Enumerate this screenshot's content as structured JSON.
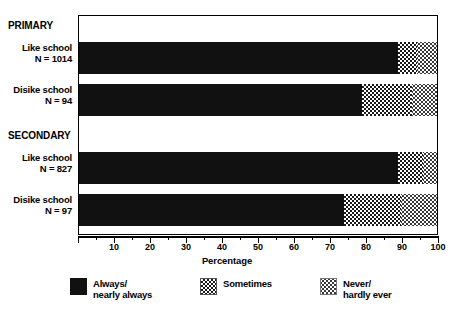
{
  "chart_data": {
    "type": "bar",
    "orientation": "horizontal",
    "stacked": true,
    "title": "",
    "xlabel": "Percentage",
    "ylabel": "",
    "xlim": [
      0,
      100
    ],
    "xticks": [
      0,
      10,
      20,
      30,
      40,
      50,
      60,
      70,
      80,
      90,
      100
    ],
    "xticklabels": [
      "",
      "10",
      "20",
      "30",
      "40",
      "50",
      "60",
      "70",
      "80",
      "90",
      "100"
    ],
    "minor_tick_step": 5,
    "grid": false,
    "legend_position": "bottom",
    "groups": [
      {
        "name": "PRIMARY"
      },
      {
        "name": "SECONDARY"
      }
    ],
    "categories": [
      "Like school N = 1014",
      "Disike school N = 94",
      "Like school N = 827",
      "Disike school N = 97"
    ],
    "series": [
      {
        "name": "Always/ nearly always",
        "values": [
          89,
          79,
          89,
          74
        ]
      },
      {
        "name": "Sometimes",
        "values": [
          5.5,
          14,
          7,
          16
        ]
      },
      {
        "name": "Never/ hardly ever",
        "values": [
          5.5,
          7,
          4,
          10
        ]
      }
    ]
  },
  "labels": {
    "group_primary": "PRIMARY",
    "group_secondary": "SECONDARY",
    "bar1_line1": "Like school",
    "bar1_line2": "N = 1014",
    "bar2_line1": "Disike school",
    "bar2_line2": "N = 94",
    "bar3_line1": "Like school",
    "bar3_line2": "N = 827",
    "bar4_line1": "Disike school",
    "bar4_line2": "N = 97"
  },
  "axis": {
    "title": "Percentage",
    "tick_0": "",
    "tick_10": "10",
    "tick_20": "20",
    "tick_30": "30",
    "tick_40": "40",
    "tick_50": "50",
    "tick_60": "60",
    "tick_70": "70",
    "tick_80": "80",
    "tick_90": "90",
    "tick_100": "100"
  },
  "legend": {
    "item1_line1": "Always/",
    "item1_line2": "nearly always",
    "item2_line1": "Sometimes",
    "item2_line2": "",
    "item3_line1": "Never/",
    "item3_line2": "hardly ever"
  },
  "colors": {
    "always": "#111111",
    "sometimes_dither": "#1a1a1a",
    "never_dither": "#2a2a2a",
    "background": "#ffffff",
    "frame": "#000000"
  }
}
